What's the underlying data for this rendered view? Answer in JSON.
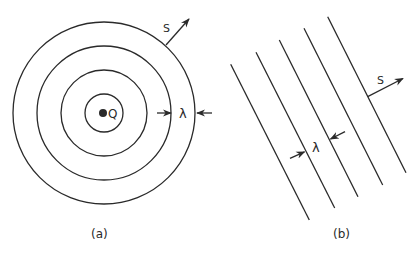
{
  "panels": {
    "a": {
      "caption": "(a)",
      "description": "Spherical wavefronts around point source",
      "source_label": "Q",
      "direction_label": "S",
      "wavelength_label": "λ",
      "center": [
        104,
        113
      ],
      "radii": [
        19,
        43,
        67,
        91
      ]
    },
    "b": {
      "caption": "(b)",
      "description": "Plane wavefronts",
      "direction_label": "S",
      "wavelength_label": "λ",
      "lines": [
        [
          [
            230.7,
            64.3
          ],
          [
            309.3,
            220
          ]
        ],
        [
          [
            256,
            52.3
          ],
          [
            334.7,
            208
          ]
        ],
        [
          [
            279.3,
            40
          ],
          [
            358,
            196.7
          ]
        ],
        [
          [
            304,
            28.3
          ],
          [
            382.7,
            185
          ]
        ],
        [
          [
            327.7,
            16.7
          ],
          [
            406,
            172.7
          ]
        ]
      ]
    }
  },
  "colors": {
    "ink": "#2a2a2a",
    "background": "#ffffff"
  }
}
